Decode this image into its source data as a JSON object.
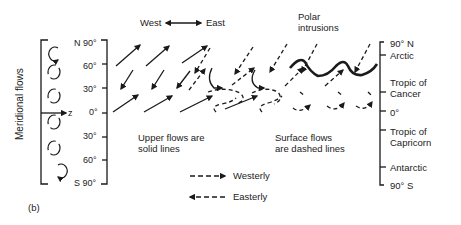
{
  "figure": {
    "panel_label": "(b)",
    "meridional": {
      "title": "Meridional flows",
      "axis_label": "z"
    },
    "latitude_axis": {
      "ticks": [
        "N 90°",
        "60°",
        "30°",
        "0°",
        "30°",
        "60°",
        "S 90°"
      ]
    },
    "direction_header": {
      "west": "West",
      "east": "East"
    },
    "polar_label": [
      "Polar",
      "intrusions"
    ],
    "upper_note": [
      "Upper flows are",
      "solid lines"
    ],
    "surface_note": [
      "Surface flows",
      "are dashed lines"
    ],
    "legend": [
      {
        "label": "Westerly",
        "style": "dashed",
        "direction": "right"
      },
      {
        "label": "Easterly",
        "style": "dashed",
        "direction": "left"
      }
    ],
    "zones_axis": {
      "labels": [
        "90° N",
        "Arctic",
        "Tropic of",
        "Cancer",
        "0°",
        "Tropic of",
        "Capricorn",
        "Antarctic",
        "90° S"
      ]
    }
  }
}
